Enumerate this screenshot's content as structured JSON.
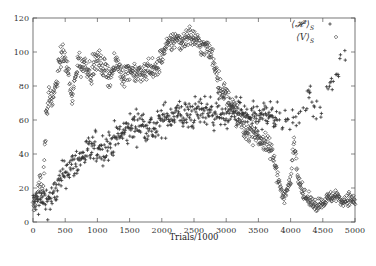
{
  "chart_data": {
    "type": "scatter",
    "title": "",
    "xlabel": "Trials/1000",
    "ylabel": "",
    "xlim": [
      0,
      5000
    ],
    "ylim": [
      0,
      120
    ],
    "grid": false,
    "legend_position": "top-right",
    "x_ticks": [
      0,
      500,
      1000,
      1500,
      2000,
      2500,
      3000,
      3500,
      4000,
      4500,
      5000
    ],
    "x_tick_labels": [
      "0",
      "500",
      "1000",
      "1500",
      "2000",
      "2500",
      "3000",
      "3500",
      "4000",
      "4500",
      "5000"
    ],
    "y_ticks": [
      0,
      20,
      40,
      60,
      80,
      100,
      120
    ],
    "y_tick_labels": [
      "0",
      "20",
      "40",
      "60",
      "80",
      "100",
      "120"
    ],
    "series": [
      {
        "name": "⟨𝓗²⟩_S",
        "label_main": "⟨𝓗²⟩",
        "label_sub": "S",
        "marker": "plus",
        "color": "#333333",
        "trend": [
          [
            0,
            11
          ],
          [
            100,
            12
          ],
          [
            200,
            13
          ],
          [
            300,
            14
          ],
          [
            400,
            22
          ],
          [
            500,
            30
          ],
          [
            600,
            33
          ],
          [
            700,
            36
          ],
          [
            800,
            40
          ],
          [
            900,
            42
          ],
          [
            1000,
            44
          ],
          [
            1100,
            43
          ],
          [
            1200,
            46
          ],
          [
            1300,
            50
          ],
          [
            1400,
            52
          ],
          [
            1500,
            55
          ],
          [
            1600,
            57
          ],
          [
            1700,
            58
          ],
          [
            1800,
            56
          ],
          [
            1900,
            54
          ],
          [
            2000,
            60
          ],
          [
            2100,
            62
          ],
          [
            2200,
            64
          ],
          [
            2300,
            63
          ],
          [
            2400,
            62
          ],
          [
            2500,
            64
          ],
          [
            2600,
            65
          ],
          [
            2700,
            66
          ],
          [
            2800,
            64
          ],
          [
            2900,
            66
          ],
          [
            3000,
            62
          ],
          [
            3100,
            64
          ],
          [
            3200,
            66
          ],
          [
            3300,
            62
          ],
          [
            3400,
            60
          ],
          [
            3500,
            60
          ],
          [
            3600,
            62
          ],
          [
            3700,
            63
          ],
          [
            3800,
            58
          ],
          [
            3900,
            57
          ],
          [
            4000,
            60
          ],
          [
            4100,
            62
          ],
          [
            4200,
            72
          ],
          [
            4300,
            76
          ],
          [
            4400,
            64
          ],
          [
            4500,
            60
          ],
          [
            4600,
            80
          ],
          [
            4700,
            92
          ],
          [
            4800,
            96
          ]
        ],
        "spread": 9,
        "density": [
          [
            0,
            5000,
            1
          ]
        ]
      },
      {
        "name": "⟨V⟩_S",
        "label_main": "⟨V⟩",
        "label_sub": "S",
        "marker": "diamond",
        "color": "#444444",
        "trend": [
          [
            0,
            8
          ],
          [
            50,
            14
          ],
          [
            100,
            25
          ],
          [
            150,
            18
          ],
          [
            200,
            60
          ],
          [
            250,
            75
          ],
          [
            300,
            72
          ],
          [
            350,
            78
          ],
          [
            400,
            92
          ],
          [
            450,
            100
          ],
          [
            500,
            94
          ],
          [
            550,
            88
          ],
          [
            600,
            70
          ],
          [
            650,
            84
          ],
          [
            700,
            96
          ],
          [
            750,
            90
          ],
          [
            800,
            94
          ],
          [
            900,
            88
          ],
          [
            1000,
            96
          ],
          [
            1100,
            90
          ],
          [
            1200,
            86
          ],
          [
            1300,
            94
          ],
          [
            1400,
            86
          ],
          [
            1500,
            90
          ],
          [
            1600,
            88
          ],
          [
            1700,
            86
          ],
          [
            1800,
            92
          ],
          [
            1900,
            88
          ],
          [
            2000,
            98
          ],
          [
            2100,
            104
          ],
          [
            2200,
            108
          ],
          [
            2300,
            106
          ],
          [
            2400,
            110
          ],
          [
            2500,
            108
          ],
          [
            2600,
            104
          ],
          [
            2700,
            102
          ],
          [
            2800,
            96
          ],
          [
            2900,
            80
          ],
          [
            3000,
            74
          ],
          [
            3100,
            68
          ],
          [
            3200,
            60
          ],
          [
            3300,
            52
          ],
          [
            3400,
            54
          ],
          [
            3500,
            50
          ],
          [
            3600,
            46
          ],
          [
            3700,
            42
          ],
          [
            3800,
            28
          ],
          [
            3850,
            18
          ],
          [
            3900,
            14
          ],
          [
            3950,
            20
          ],
          [
            4000,
            24
          ],
          [
            4050,
            50
          ],
          [
            4100,
            30
          ],
          [
            4200,
            16
          ],
          [
            4300,
            12
          ],
          [
            4400,
            10
          ],
          [
            4500,
            12
          ],
          [
            4600,
            14
          ],
          [
            4700,
            16
          ],
          [
            4800,
            12
          ],
          [
            4900,
            14
          ],
          [
            5000,
            12
          ]
        ],
        "spread": 6
      }
    ]
  }
}
